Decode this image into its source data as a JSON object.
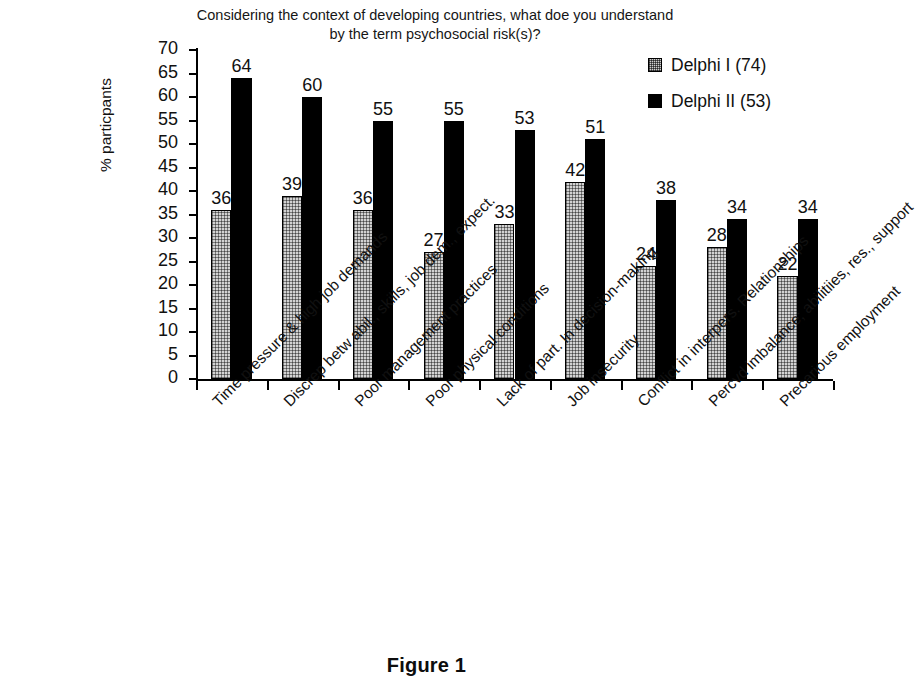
{
  "chart_data": {
    "type": "bar",
    "title": "Considering the context of developing countries, what doe you understand by the term psychosocial risk(s)?",
    "title_line1": "Considering the context of developing countries, what doe you understand",
    "title_line2": "by the term psychosocial risk(s)?",
    "xlabel": "",
    "ylabel": "% particpants",
    "ylim": [
      0,
      70
    ],
    "ytick_step": 5,
    "yticks": [
      0,
      5,
      10,
      15,
      20,
      25,
      30,
      35,
      40,
      45,
      50,
      55,
      60,
      65,
      70
    ],
    "grid": false,
    "legend_position": "top-right",
    "categories": [
      "Time pressure & high job demands",
      "Discrep betw abil., skills, job dem., expect.",
      "Poor management practices",
      "Poor physical conditions",
      "Lack of part. In decision-making",
      "Job insecurity",
      "Conflict in interpers. Relationships",
      "Percvd imbalance; abilitiies, res., support",
      "Precarious employment"
    ],
    "series": [
      {
        "name": "Delphi I (74)",
        "color": "#d2d2d2",
        "pattern": "dotted-fill",
        "values": [
          36,
          39,
          36,
          27,
          33,
          42,
          24,
          28,
          22
        ]
      },
      {
        "name": "Delphi II (53)",
        "color": "#000000",
        "pattern": "solid-fill",
        "values": [
          64,
          60,
          55,
          55,
          53,
          51,
          38,
          34,
          34
        ]
      }
    ]
  },
  "caption": "Figure 1"
}
